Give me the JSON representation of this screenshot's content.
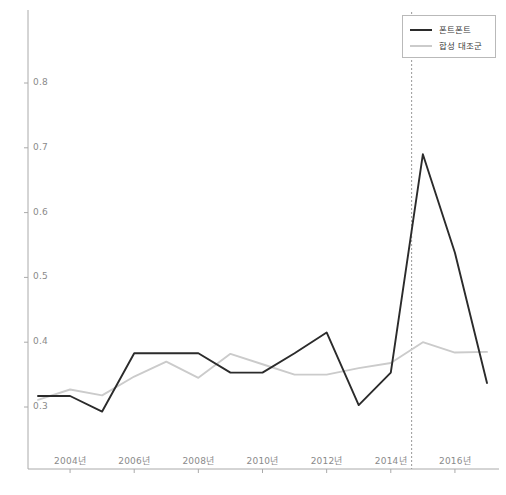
{
  "chart_data": {
    "type": "line",
    "title": "",
    "xlabel": "",
    "ylabel": "",
    "xlim": [
      2002.6,
      2017.4
    ],
    "ylim": [
      0.268,
      0.818
    ],
    "grid": false,
    "legend_position": "top-right",
    "x_tick_labels": [
      "2004년",
      "2006년",
      "2008년",
      "2010년",
      "2012년",
      "2014년",
      "2016년"
    ],
    "x_ticks": [
      2004,
      2006,
      2008,
      2010,
      2012,
      2014,
      2016
    ],
    "y_tick_labels": [
      "0.3",
      "0.4",
      "0.5",
      "0.6",
      "0.7",
      "0.8"
    ],
    "y_ticks": [
      0.3,
      0.4,
      0.5,
      0.6,
      0.7,
      0.8
    ],
    "annotations": [
      {
        "name": "intervention-line",
        "type": "vline",
        "x": 2014.65,
        "style": "dashed",
        "color": "#999999"
      }
    ],
    "x": [
      2003,
      2004,
      2005,
      2006,
      2007,
      2008,
      2009,
      2010,
      2011,
      2012,
      2013,
      2014,
      2015,
      2016,
      2017
    ],
    "series": [
      {
        "name": "폰트폰트",
        "color": "#2b2b2b",
        "width": 1.9,
        "values": [
          0.317,
          0.317,
          0.293,
          0.383,
          0.383,
          0.383,
          0.353,
          0.353,
          0.383,
          0.415,
          0.303,
          0.353,
          0.69,
          0.538,
          0.337
        ]
      },
      {
        "name": "합성 대조군",
        "color": "#cbcbcb",
        "width": 1.9,
        "values": [
          0.311,
          0.327,
          0.318,
          0.347,
          0.37,
          0.345,
          0.382,
          0.366,
          0.35,
          0.35,
          0.36,
          0.368,
          0.4,
          0.384,
          0.385
        ]
      }
    ]
  },
  "legend": {
    "entries": [
      {
        "label": "폰트폰트",
        "color": "#2b2b2b"
      },
      {
        "label": "합성 대조군",
        "color": "#cbcbcb"
      }
    ]
  },
  "axes": {
    "y_axis_color": "#aaaaaa",
    "x_axis_color": "#aaaaaa"
  }
}
